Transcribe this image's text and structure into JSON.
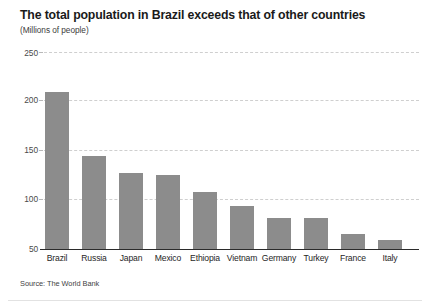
{
  "chart_data": {
    "type": "bar",
    "title": "The total population in Brazil exceeds that of other countries",
    "subtitle": "(Millions of people)",
    "xlabel": "",
    "ylabel": "",
    "categories": [
      "Brazil",
      "Russia",
      "Japan",
      "Mexico",
      "Ethiopia",
      "Vietnam",
      "Germany",
      "Turkey",
      "France",
      "Italy"
    ],
    "values": [
      209,
      144,
      127,
      125,
      108,
      94,
      81,
      81,
      65,
      59
    ],
    "ylim": [
      50,
      250
    ],
    "yticks": [
      250,
      200,
      150,
      100,
      50
    ],
    "ytick_labels": [
      "250",
      "200",
      "150",
      "100",
      "50"
    ],
    "grid": true,
    "legend": null,
    "source": "Source: The World Bank",
    "bar_color": "#8c8c8c",
    "grid_color": "#cfcfcf",
    "axis_color": "#2b2b2b"
  }
}
